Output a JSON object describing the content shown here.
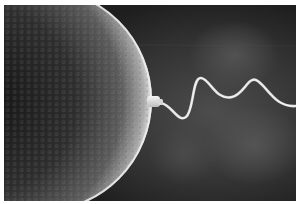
{
  "image": {
    "subject": "Sperm cell fertilizing an egg cell",
    "style": "grayscale micrograph-style illustration",
    "elements": [
      "egg-cell",
      "sperm-head",
      "sperm-tail",
      "dark-background"
    ],
    "colors": {
      "background": "#2a2a2a",
      "background_glow": "#4a4a4a",
      "egg_dark": "#1a1a1a",
      "egg_mid": "#5a5a5a",
      "egg_rim": "#e8e8e8",
      "sperm": "#e6e6e6",
      "border": "#ffffff"
    }
  }
}
